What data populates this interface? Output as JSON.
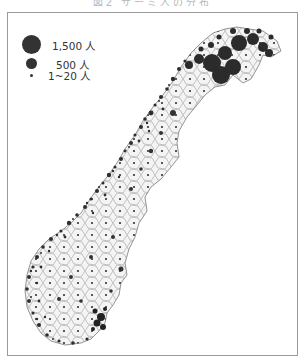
{
  "figure": {
    "title_partial": "図2 サーミ人の分布",
    "map_subject": "Norway municipalities – dot distribution",
    "colors": {
      "dot": "#333333",
      "outline": "#7a7a7a",
      "land": "#f4f4f4",
      "frame": "#9a9a9a"
    }
  },
  "legend": {
    "items": [
      {
        "label": "1,500 人",
        "size": "large",
        "diameter": 19
      },
      {
        "label": "500 人",
        "size": "medium",
        "diameter": 11
      },
      {
        "label": "1~20 人",
        "size": "small",
        "diameter": 3
      }
    ]
  }
}
